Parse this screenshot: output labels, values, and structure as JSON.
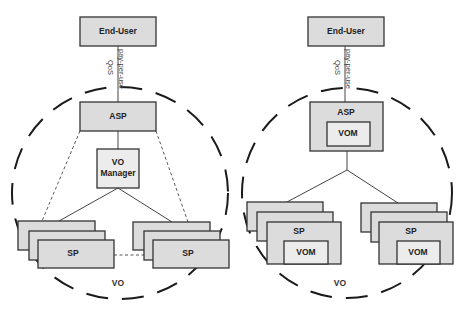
{
  "diagrams": [
    {
      "id": "left",
      "end_user": "End-User",
      "link_label_top": "pay-per-use",
      "link_label_bottom": "QoS",
      "asp": "ASP",
      "vo_manager_line1": "VO",
      "vo_manager_line2": "Manager",
      "sp_left": "SP",
      "sp_right": "SP",
      "region": "VO"
    },
    {
      "id": "right",
      "end_user": "End-User",
      "link_label_top": "pay-per-use",
      "link_label_bottom": "QoS",
      "asp": "ASP",
      "asp_inner": "VOM",
      "sp_left": "SP",
      "sp_left_inner": "VOM",
      "sp_right": "SP",
      "sp_right_inner": "VOM",
      "region": "VO"
    }
  ],
  "colors": {
    "box_fill": "#dcdcdc",
    "inner_box_fill": "#ececec",
    "stroke": "#333333"
  }
}
